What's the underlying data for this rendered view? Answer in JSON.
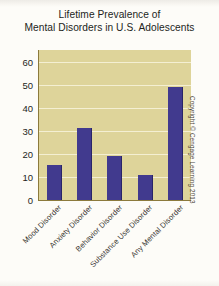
{
  "chart_data": {
    "type": "bar",
    "title": "Lifetime Prevalence of Mental Disorders in U.S. Adolescents",
    "title_lines": [
      "Lifetime Prevalence of",
      "Mental Disorders in U.S. Adolescents"
    ],
    "categories": [
      "Mood Disorder",
      "Anxiety Disorder",
      "Behavior Disorder",
      "Substance Use Disorder",
      "Any Mental Disorder"
    ],
    "values": [
      15,
      31,
      19,
      11,
      49
    ],
    "xlabel": "",
    "ylabel": "",
    "ylim": [
      0,
      65
    ],
    "yticks": [
      0,
      10,
      20,
      30,
      40,
      50,
      60
    ],
    "ytick_labels": [
      "0",
      "10",
      "20",
      "30",
      "40",
      "50",
      "60"
    ],
    "grid": true,
    "grid_axis": "y",
    "legend": false,
    "bar_color": "#413a8e",
    "plot_background": "#ded49a",
    "gridline_color": "#f4efd2",
    "axis_color": "#8c7a3c"
  },
  "annotations": {
    "copyright": "Copyright © Cengage Learning 2013"
  }
}
